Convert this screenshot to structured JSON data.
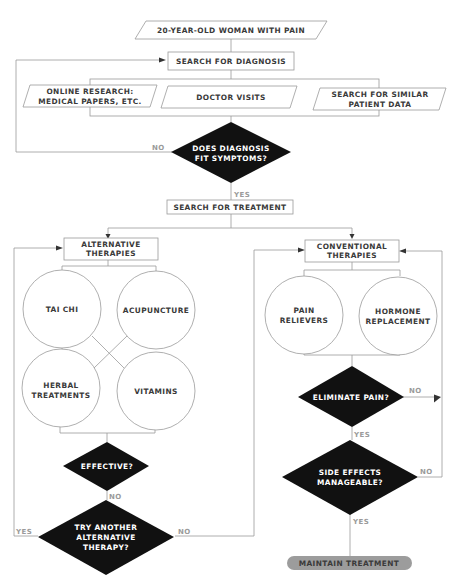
{
  "nodes": {
    "start": "20-YEAR-OLD WOMAN WITH PAIN",
    "search_diagnosis": "SEARCH FOR DIAGNOSIS",
    "online_research": [
      "ONLINE RESEARCH:",
      "MEDICAL PAPERS, ETC."
    ],
    "doctor_visits": "DOCTOR VISITS",
    "similar_patient": [
      "SEARCH FOR SIMILAR",
      "PATIENT DATA"
    ],
    "diagnosis_fit": [
      "DOES DIAGNOSIS",
      "FIT SYMPTOMS?"
    ],
    "search_treatment": "SEARCH FOR TREATMENT",
    "alternative": [
      "ALTERNATIVE",
      "THERAPIES"
    ],
    "conventional": [
      "CONVENTIONAL",
      "THERAPIES"
    ],
    "tai_chi": "TAI CHI",
    "acupuncture": "ACUPUNCTURE",
    "herbal": [
      "HERBAL",
      "TREATMENTS"
    ],
    "vitamins": "VITAMINS",
    "pain_relievers": [
      "PAIN",
      "RELIEVERS"
    ],
    "hormone": [
      "HORMONE",
      "REPLACEMENT"
    ],
    "effective": "EFFECTIVE?",
    "try_another": [
      "TRY ANOTHER",
      "ALTERNATIVE",
      "THERAPY?"
    ],
    "eliminate_pain": "ELIMINATE PAIN?",
    "side_effects": [
      "SIDE EFFECTS",
      "MANAGEABLE?"
    ],
    "maintain": "MAINTAIN TREATMENT"
  },
  "edge_labels": {
    "diag_no": "NO",
    "diag_yes": "YES",
    "effective_no": "NO",
    "try_yes": "YES",
    "try_no": "NO",
    "elim_no": "NO",
    "elim_yes": "YES",
    "side_no": "NO",
    "side_yes": "YES"
  }
}
